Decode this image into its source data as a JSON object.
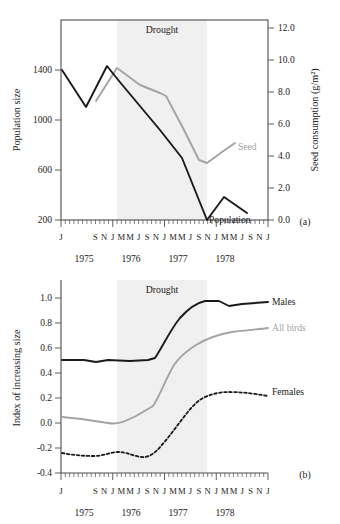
{
  "figure": {
    "panel_a_label": "(a)",
    "panel_b_label": "(b)"
  },
  "panel_a": {
    "left_axis_title": "Population size",
    "right_axis_title": "Seed consumption (g/m²)",
    "drought_label": "Drought",
    "series_labels": {
      "population": "Population",
      "seed": "Seed"
    },
    "left_ticks": [
      "200",
      "600",
      "1000",
      "1400"
    ],
    "right_ticks": [
      "0.0",
      "2.0",
      "4.0",
      "6.0",
      "8.0",
      "10.0",
      "12.0"
    ],
    "months": [
      "J",
      "S",
      "N",
      "J",
      "M",
      "M",
      "J",
      "S",
      "N",
      "J",
      "M",
      "M",
      "J",
      "S",
      "N",
      "J",
      "M",
      "M",
      "J",
      "S",
      "N",
      "J"
    ],
    "years": [
      "1975",
      "1976",
      "1977",
      "1978"
    ]
  },
  "panel_b": {
    "left_axis_title": "Index of increasing size",
    "drought_label": "Drought",
    "series_labels": {
      "males": "Males",
      "all_birds": "All birds",
      "females": "Females"
    },
    "left_ticks": [
      "-0.4",
      "-0.2",
      "0.0",
      "0.2",
      "0.4",
      "0.6",
      "0.8",
      "1.0"
    ],
    "months": [
      "J",
      "S",
      "N",
      "J",
      "M",
      "M",
      "J",
      "S",
      "N",
      "J",
      "M",
      "M",
      "J",
      "S",
      "N",
      "J",
      "M",
      "M",
      "J",
      "S",
      "N",
      "J"
    ],
    "years": [
      "1975",
      "1976",
      "1977",
      "1978"
    ]
  },
  "colors": {
    "dark_line": "#1a1a1a",
    "gray_line": "#a3a3a3",
    "drought_band": "#f0f0f0",
    "frame": "#4d4d4d"
  },
  "chart_data": [
    {
      "type": "line",
      "title": "(a) Population size and seed consumption",
      "xlabel": "",
      "ylabel": "Population size",
      "y2label": "Seed consumption (g/m²)",
      "ylim": [
        100,
        1500
      ],
      "y2lim": [
        0.0,
        12.6
      ],
      "yticks": [
        200,
        600,
        1000,
        1400
      ],
      "y2ticks": [
        0.0,
        2.0,
        4.0,
        6.0,
        8.0,
        10.0,
        12.0
      ],
      "grid": false,
      "legend": "inline-labels",
      "annotations": [
        {
          "text": "Drought",
          "x_start": "1976-01",
          "x_end": "1977-12"
        }
      ],
      "x": [
        "1975-01",
        "1975-07",
        "1976-01",
        "1976-04",
        "1976-07",
        "1977-01",
        "1977-04",
        "1977-07",
        "1978-01",
        "1978-07",
        "1979-01"
      ],
      "series": [
        {
          "name": "Population",
          "axis": "left",
          "style": "solid-dark",
          "x": [
            "1975-01",
            "1975-09",
            "1976-01",
            "1976-05",
            "1977-01",
            "1977-07",
            "1978-01",
            "1978-07",
            "1979-01"
          ],
          "values": [
            1400,
            1100,
            1430,
            1180,
            630,
            410,
            195,
            380,
            255
          ]
        },
        {
          "name": "Seed",
          "axis": "right",
          "style": "solid-gray",
          "x": [
            "1975-09",
            "1976-01",
            "1976-07",
            "1977-01",
            "1977-07",
            "1978-01",
            "1978-07"
          ],
          "values": [
            7.6,
            10.4,
            8.4,
            7.9,
            4.5,
            2.7,
            3.8
          ]
        }
      ]
    },
    {
      "type": "line",
      "title": "(b) Index of increasing size",
      "xlabel": "",
      "ylabel": "Index of increasing size",
      "ylim": [
        -0.4,
        1.1
      ],
      "yticks": [
        -0.4,
        -0.2,
        0.0,
        0.2,
        0.4,
        0.6,
        0.8,
        1.0
      ],
      "grid": false,
      "legend": "inline-labels",
      "annotations": [
        {
          "text": "Drought",
          "x_start": "1976-01",
          "x_end": "1977-12"
        }
      ],
      "series": [
        {
          "name": "Males",
          "style": "solid-dark",
          "x": [
            "1975-01",
            "1975-07",
            "1976-01",
            "1976-07",
            "1977-01",
            "1977-04",
            "1977-07",
            "1977-11",
            "1978-03",
            "1978-07",
            "1979-01"
          ],
          "values": [
            0.535,
            0.52,
            0.53,
            0.515,
            0.53,
            0.72,
            0.87,
            0.98,
            0.965,
            0.925,
            0.965
          ]
        },
        {
          "name": "All birds",
          "style": "solid-gray",
          "x": [
            "1975-01",
            "1975-07",
            "1976-01",
            "1976-07",
            "1977-01",
            "1977-04",
            "1977-07",
            "1977-11",
            "1978-05",
            "1979-01"
          ],
          "values": [
            0.045,
            0.02,
            0.0,
            0.06,
            0.135,
            0.4,
            0.58,
            0.68,
            0.77,
            0.79
          ]
        },
        {
          "name": "Females",
          "style": "dashed-dark",
          "x": [
            "1975-01",
            "1975-07",
            "1976-01",
            "1976-05",
            "1976-09",
            "1977-01",
            "1977-05",
            "1977-09",
            "1978-01",
            "1978-07",
            "1979-01"
          ],
          "values": [
            -0.24,
            -0.255,
            -0.225,
            -0.255,
            -0.27,
            -0.195,
            -0.085,
            0.14,
            0.3,
            0.315,
            0.285
          ]
        }
      ]
    }
  ]
}
